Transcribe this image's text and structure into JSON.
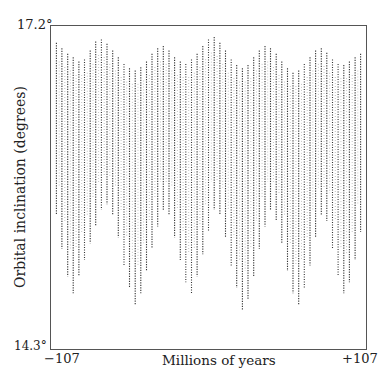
{
  "chart_data": {
    "type": "scatter",
    "title": "",
    "xlabel": "Millions of years",
    "ylabel": "Orbital inclination (degrees)",
    "x_tick_labels": [
      "−107",
      "+107"
    ],
    "y_tick_labels": [
      "14.3°",
      "17.2°"
    ],
    "xlim": [
      -107,
      107
    ],
    "ylim": [
      14.3,
      17.2
    ],
    "grid": false,
    "legend": null,
    "series": [
      {
        "name": "Orbital inclination",
        "style": "dense vertical dotted oscillation bands",
        "note": "Each entry is one oscillation cycle: [time (Myr), min inclination (deg), max inclination (deg)]",
        "cycles": [
          [
            -104.0,
            15.5,
            17.05
          ],
          [
            -100.2,
            15.2,
            17.0
          ],
          [
            -96.3,
            14.95,
            16.95
          ],
          [
            -92.5,
            14.8,
            16.92
          ],
          [
            -88.6,
            14.95,
            16.88
          ],
          [
            -84.8,
            15.1,
            16.9
          ],
          [
            -80.9,
            15.25,
            16.98
          ],
          [
            -77.1,
            15.4,
            17.06
          ],
          [
            -73.2,
            15.55,
            17.08
          ],
          [
            -69.4,
            15.6,
            17.04
          ],
          [
            -65.5,
            15.5,
            16.98
          ],
          [
            -61.7,
            15.3,
            16.92
          ],
          [
            -57.8,
            15.05,
            16.86
          ],
          [
            -54.0,
            14.85,
            16.82
          ],
          [
            -50.1,
            14.7,
            16.8
          ],
          [
            -46.3,
            14.8,
            16.83
          ],
          [
            -42.4,
            15.0,
            16.88
          ],
          [
            -38.6,
            15.2,
            16.95
          ],
          [
            -34.7,
            15.4,
            17.0
          ],
          [
            -30.9,
            15.55,
            17.02
          ],
          [
            -27.0,
            15.5,
            16.98
          ],
          [
            -23.2,
            15.3,
            16.92
          ],
          [
            -19.3,
            15.1,
            16.88
          ],
          [
            -15.5,
            14.9,
            16.86
          ],
          [
            -11.6,
            14.8,
            16.9
          ],
          [
            -7.8,
            14.95,
            16.95
          ],
          [
            -3.9,
            15.15,
            17.02
          ],
          [
            0.0,
            15.35,
            17.08
          ],
          [
            3.9,
            15.55,
            17.1
          ],
          [
            7.8,
            15.5,
            17.05
          ],
          [
            11.6,
            15.3,
            16.98
          ],
          [
            15.5,
            15.05,
            16.9
          ],
          [
            19.3,
            14.85,
            16.85
          ],
          [
            23.2,
            14.65,
            16.82
          ],
          [
            27.0,
            14.75,
            16.85
          ],
          [
            30.9,
            14.95,
            16.92
          ],
          [
            34.7,
            15.2,
            16.98
          ],
          [
            38.6,
            15.4,
            17.02
          ],
          [
            42.4,
            15.55,
            17.0
          ],
          [
            46.3,
            15.45,
            16.95
          ],
          [
            50.1,
            15.25,
            16.88
          ],
          [
            54.0,
            15.0,
            16.82
          ],
          [
            57.8,
            14.8,
            16.78
          ],
          [
            61.7,
            14.7,
            16.8
          ],
          [
            65.5,
            14.85,
            16.86
          ],
          [
            69.4,
            15.05,
            16.92
          ],
          [
            73.2,
            15.3,
            16.98
          ],
          [
            77.1,
            15.5,
            17.0
          ],
          [
            80.9,
            15.45,
            16.96
          ],
          [
            84.8,
            15.2,
            16.9
          ],
          [
            88.6,
            14.95,
            16.86
          ],
          [
            92.5,
            14.8,
            16.85
          ],
          [
            96.3,
            14.9,
            16.88
          ],
          [
            100.2,
            15.1,
            16.92
          ],
          [
            104.0,
            15.35,
            16.95
          ]
        ]
      }
    ]
  },
  "axes": {
    "x_min_label": "−107",
    "x_max_label": "+107",
    "y_min_label": "14.3°",
    "y_max_label": "17.2°",
    "x_title": "Millions of years",
    "y_title": "Orbital inclination (degrees)"
  },
  "colors": {
    "background": "#ffffff",
    "frame": "#555555",
    "data": "#333333",
    "text": "#222222"
  }
}
